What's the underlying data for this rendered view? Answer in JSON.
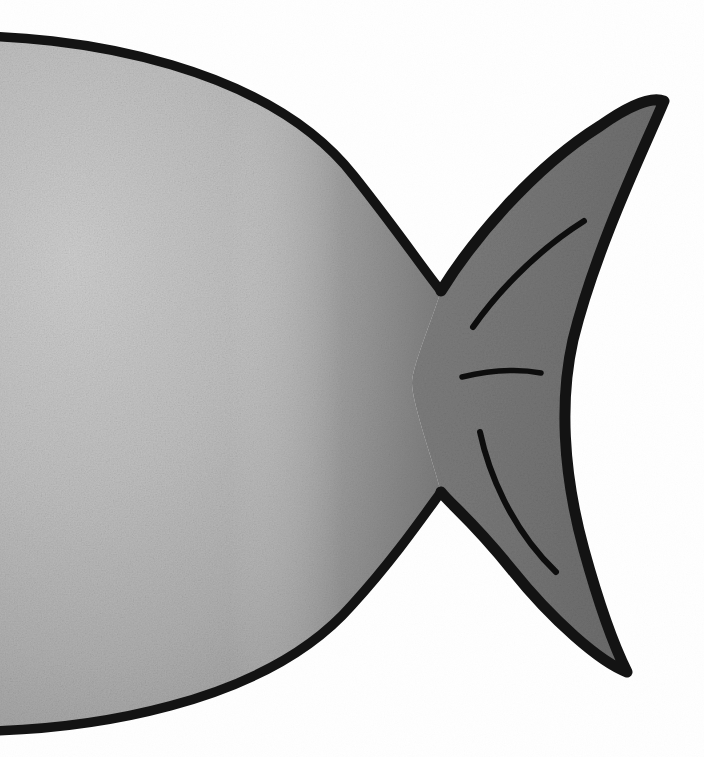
{
  "artwork": {
    "title": "Fish",
    "subject": "fish-silhouette",
    "medium": "marker-drawing-on-paper",
    "style": "hand-drawn-cartoon",
    "orientation": "facing-left",
    "canvas": {
      "width": 704,
      "height": 757
    },
    "background_color": "#ffffff",
    "cropped": "body extends past left edge of frame"
  },
  "palette": {
    "background": "#ffffff",
    "outline": "#111111",
    "body_fill_light": "#c6c6c6",
    "body_fill_mid": "#b2b2b2",
    "body_fill_shadow": "#9a9a9a",
    "tail_fill": "#767676",
    "tail_fill_dark": "#6a6a6a",
    "detail_stroke": "#0d0d0d"
  },
  "parts": [
    {
      "id": "body",
      "name": "fish-body",
      "shape": "large rounded oval, cropped at left frame edge",
      "fill": "#b2b2b2",
      "outline_color": "#111111",
      "outline_width_px": 9,
      "bounds": {
        "x": -60,
        "y": 35,
        "width": 500,
        "height": 700
      },
      "shading": "light in upper-left, darkening toward the right where it joins the tail"
    },
    {
      "id": "tail",
      "name": "fish-tail-fin",
      "shape": "forked caudal fin with two pointed lobes and a concave trailing edge",
      "fill": "#767676",
      "outline_color": "#111111",
      "outline_width_px": 11,
      "upper_tip": {
        "x": 664,
        "y": 101
      },
      "lower_tip": {
        "x": 627,
        "y": 672
      },
      "trailing_edge": "concave, pinched toward x=560 at mid-height",
      "bounds": {
        "x": 400,
        "y": 95,
        "width": 270,
        "height": 585
      }
    },
    {
      "id": "notch-upper",
      "name": "tail-upper-notch",
      "shape": "narrow white V cut between body back and upper tail lobe",
      "apex": {
        "x": 441,
        "y": 291
      }
    },
    {
      "id": "notch-lower",
      "name": "tail-lower-notch",
      "shape": "narrow white V cut between body belly and lower tail lobe",
      "apex": {
        "x": 437,
        "y": 498
      }
    }
  ],
  "detail_strokes": [
    {
      "id": "stroke-upper",
      "name": "tail-upper-ray-line",
      "description": "long tapered arc sweeping up-right inside the upper tail lobe",
      "from": {
        "x": 473,
        "y": 327
      },
      "to": {
        "x": 584,
        "y": 221
      },
      "stroke_width_px": 6
    },
    {
      "id": "stroke-middle",
      "name": "tail-middle-ray-line",
      "description": "short horizontal tapered stroke at the tail's waist",
      "from": {
        "x": 462,
        "y": 377
      },
      "to": {
        "x": 541,
        "y": 372
      },
      "stroke_width_px": 6
    },
    {
      "id": "stroke-lower",
      "name": "tail-lower-ray-line",
      "description": "long tapered arc sweeping down-right inside the lower tail lobe",
      "from": {
        "x": 480,
        "y": 432
      },
      "to": {
        "x": 556,
        "y": 572
      },
      "stroke_width_px": 6
    }
  ],
  "texture": {
    "name": "paper-grain",
    "type": "mottled fibrous marker-on-paper speckle",
    "intensity": "subtle"
  }
}
